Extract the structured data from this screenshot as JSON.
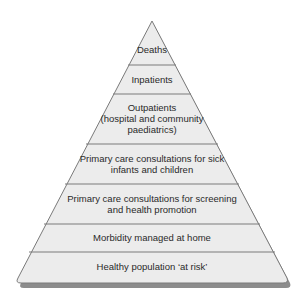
{
  "diagram": {
    "type": "pyramid",
    "colors": {
      "fill": "#ececec",
      "stroke": "#7a7a7a",
      "shadow": "#8c8c8c",
      "text": "#2a2a2a"
    },
    "layers": [
      {
        "label": "Deaths"
      },
      {
        "label": "Inpatients"
      },
      {
        "label": "Outpatients\n(hospital and community\npaediatrics)"
      },
      {
        "label": "Primary care consultations for sick\ninfants and children"
      },
      {
        "label": "Primary care consultations for screening\nand health promotion"
      },
      {
        "label": "Morbidity managed at home"
      },
      {
        "label": "Healthy population ‘at risk’"
      }
    ]
  }
}
